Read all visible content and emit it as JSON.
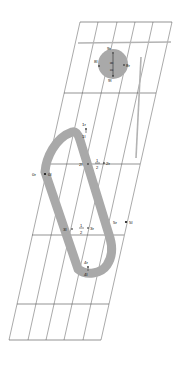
{
  "diagram": {
    "background_color": "#ffffff",
    "grid": {
      "line_color": "#555555",
      "horizontal_line_color": "#4a4a4a",
      "shear": "parallelogram mesh, columns slanted right-to-left going down",
      "column_count": 6,
      "row_count": 5,
      "top_left": [
        80,
        22
      ],
      "top_right": [
        172,
        22
      ],
      "bottom_left": [
        9,
        340
      ],
      "bottom_right": [
        101,
        340
      ]
    },
    "shapes": {
      "track": {
        "name": "stadium-track",
        "fill": "none",
        "stroke_color": "#a9a9a9",
        "stroke_width": 9,
        "description": "rounded stadium outline spanning mid grid"
      },
      "blob": {
        "name": "circular-region",
        "fill_color": "#a9a9a9",
        "center": [
          113,
          64
        ],
        "radius": 15
      },
      "accent_line": {
        "name": "vertical-accent-line",
        "color": "#b3b3b3",
        "from": [
          140,
          57
        ],
        "to": [
          136,
          158
        ]
      },
      "accent_line_h": {
        "name": "horizontal-accent-line",
        "color": "#b3b3b3",
        "from": [
          78,
          43
        ],
        "to": [
          171,
          42
        ]
      }
    },
    "labels": [
      {
        "id": "p0",
        "text_left": "0r",
        "text_right": "0l",
        "x": 46,
        "y": 174,
        "style": "inline"
      },
      {
        "id": "p1",
        "text_top": "1r",
        "text_bottom": "1l",
        "x": 86,
        "y": 128,
        "style": "stacked"
      },
      {
        "id": "p2",
        "text_left": "2l",
        "text_right": "2r",
        "x": 98,
        "y": 164,
        "style": "fraction"
      },
      {
        "id": "p3",
        "text_left": "3l",
        "text_right": "3r",
        "x": 82,
        "y": 229,
        "style": "fraction"
      },
      {
        "id": "p4",
        "text_top": "4r",
        "text_bottom": "4l",
        "x": 88,
        "y": 266,
        "style": "stacked"
      },
      {
        "id": "p5",
        "text_left": "5r",
        "text_right": "5l",
        "x": 126,
        "y": 222,
        "style": "inline"
      },
      {
        "id": "p8",
        "text_left": "8l",
        "text_right": "8r",
        "x": 113,
        "y": 64,
        "style": "inline"
      },
      {
        "id": "p9",
        "text_top": "9r",
        "text_bottom": "9l",
        "x": 113,
        "y": 52,
        "style": "stacked"
      }
    ],
    "fraction_numerator": "1",
    "fraction_denominator": "2",
    "chain_labels": [
      "9r",
      "8",
      "0",
      "9l"
    ]
  }
}
